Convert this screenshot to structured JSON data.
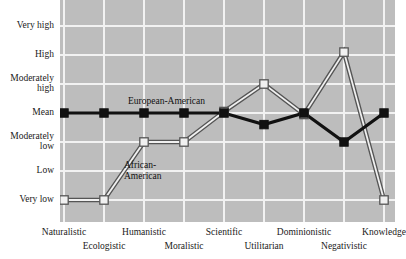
{
  "chart_data": {
    "type": "line",
    "title": "",
    "xlabel": "",
    "ylabel": "",
    "grid": true,
    "legend_position": "inline-annotation",
    "categories": [
      "Naturalistic",
      "Ecologistic",
      "Humanistic",
      "Moralistic",
      "Scientific",
      "Utilitarian",
      "Dominionistic",
      "Negativistic",
      "Knowledge"
    ],
    "ytick_labels": [
      "Very high",
      "High",
      "Moderately\nhigh",
      "Mean",
      "Moderately\nlow",
      "Low",
      "Very low"
    ],
    "ylim": [
      "Very low",
      "Very high"
    ],
    "y_scale_values": [
      3,
      2,
      1,
      0,
      -1,
      -2,
      -3
    ],
    "series": [
      {
        "name": "European-American",
        "marker": "filled-square",
        "color": "#111111",
        "values": [
          0,
          0,
          0,
          0,
          0,
          -0.4,
          0,
          -1.0,
          0
        ],
        "value_labels": [
          "Mean",
          "Mean",
          "Mean",
          "Mean",
          "Mean",
          "Below mean",
          "Mean",
          "Moderately low",
          "Mean"
        ]
      },
      {
        "name": "African-American",
        "marker": "open-square",
        "color": "#f0f0f0",
        "values": [
          -3,
          -3,
          -1,
          -1,
          0.05,
          1.0,
          -0.05,
          2.1,
          -3
        ],
        "value_labels": [
          "Very low",
          "Very low",
          "Moderately low",
          "Moderately low",
          "Mean",
          "Moderately high",
          "Mean",
          "High",
          "Very low"
        ]
      }
    ],
    "annotations": [
      {
        "text": "European-American",
        "anchor": "series-1-inline"
      },
      {
        "text": "African-\nAmerican",
        "anchor": "series-2-inline"
      }
    ]
  },
  "axes": {
    "y_labels": [
      {
        "text": "Very high"
      },
      {
        "text": "High"
      },
      {
        "text": "Moderately\nhigh"
      },
      {
        "text": "Mean"
      },
      {
        "text": "Moderately\nlow"
      },
      {
        "text": "Low"
      },
      {
        "text": "Very low"
      }
    ],
    "x_labels": [
      {
        "text": "Naturalistic"
      },
      {
        "text": "Ecologistic"
      },
      {
        "text": "Humanistic"
      },
      {
        "text": "Moralistic"
      },
      {
        "text": "Scientific"
      },
      {
        "text": "Utilitarian"
      },
      {
        "text": "Dominionistic"
      },
      {
        "text": "Negativistic"
      },
      {
        "text": "Knowledge"
      }
    ]
  },
  "labels": {
    "european_american": "European-American",
    "african_american": "African-\nAmerican"
  },
  "colors": {
    "plot_background": "#bdbdbd",
    "gridline": "#f2f2f2",
    "series_european": "#111111",
    "series_african_fill": "#f0f0f0",
    "series_african_stroke": "#555555",
    "text": "#1a1a1a",
    "page_background": "#ffffff"
  }
}
